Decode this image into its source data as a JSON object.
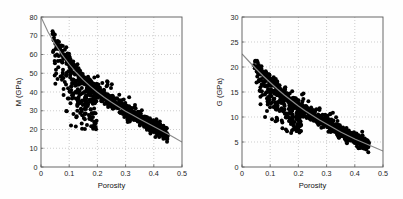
{
  "figure": {
    "name": "porosity-vs-elastic-moduli-scatter-figure",
    "background_color": "#fefefe",
    "panel_count": 2
  },
  "chart_data": [
    {
      "type": "scatter",
      "id": "left-panel",
      "title": "",
      "xlabel": "Porosity",
      "ylabel": "M (GPa)",
      "xlim": [
        0,
        0.5
      ],
      "ylim": [
        0,
        80
      ],
      "xticks": [
        0,
        0.1,
        0.2,
        0.3,
        0.4,
        0.5
      ],
      "xticklabels": [
        "0",
        "0.1",
        "0.2",
        "0.3",
        "0.4",
        "0.5"
      ],
      "yticks": [
        0,
        10,
        20,
        30,
        40,
        50,
        60,
        70,
        80
      ],
      "yticklabels": [
        "0",
        "10",
        "20",
        "30",
        "40",
        "50",
        "60",
        "70",
        "80"
      ],
      "grid": true,
      "legend": null,
      "marker_color": "#000000",
      "marker_size": 2.0,
      "trend_color": "#8a8a8a",
      "trend_label": "modified upper Hashin-Shtrikman / fit curve",
      "trend_points": [
        [
          0.0,
          80.0
        ],
        [
          0.025,
          72.0
        ],
        [
          0.05,
          65.5
        ],
        [
          0.075,
          59.8
        ],
        [
          0.1,
          54.8
        ],
        [
          0.125,
          50.4
        ],
        [
          0.15,
          46.5
        ],
        [
          0.175,
          43.0
        ],
        [
          0.2,
          39.9
        ],
        [
          0.225,
          37.1
        ],
        [
          0.25,
          34.5
        ],
        [
          0.275,
          32.1
        ],
        [
          0.3,
          29.8
        ],
        [
          0.325,
          27.7
        ],
        [
          0.35,
          25.6
        ],
        [
          0.375,
          23.6
        ],
        [
          0.4,
          21.6
        ],
        [
          0.425,
          19.6
        ],
        [
          0.45,
          17.6
        ],
        [
          0.475,
          15.5
        ],
        [
          0.5,
          13.3
        ]
      ],
      "main_trend_band": {
        "x_range": [
          0.04,
          0.45
        ],
        "half_width_y": 3.6,
        "description": "dense narrow cloud hugging the fit curve"
      },
      "scatter_subcloud": {
        "x_range": [
          0.04,
          0.2
        ],
        "y_range": [
          20,
          57
        ],
        "description": "diffuse low-modulus outlier population below main band"
      },
      "n_points": 900
    },
    {
      "type": "scatter",
      "id": "right-panel",
      "title": "",
      "xlabel": "Porosity",
      "ylabel": "G (GPa)",
      "xlim": [
        0,
        0.5
      ],
      "ylim": [
        0,
        30
      ],
      "xticks": [
        0,
        0.1,
        0.2,
        0.3,
        0.4,
        0.5
      ],
      "xticklabels": [
        "0",
        "0.1",
        "0.2",
        "0.3",
        "0.4",
        "0.5"
      ],
      "yticks": [
        0,
        5,
        10,
        15,
        20,
        25,
        30
      ],
      "yticklabels": [
        "0",
        "5",
        "10",
        "15",
        "20",
        "25",
        "30"
      ],
      "grid": true,
      "legend": null,
      "marker_color": "#000000",
      "marker_size": 2.0,
      "trend_color": "#8a8a8a",
      "trend_label": "modified upper Hashin-Shtrikman / fit curve",
      "trend_points": [
        [
          0.0,
          22.6
        ],
        [
          0.025,
          21.1
        ],
        [
          0.05,
          19.6
        ],
        [
          0.075,
          18.2
        ],
        [
          0.1,
          16.9
        ],
        [
          0.125,
          15.6
        ],
        [
          0.15,
          14.4
        ],
        [
          0.175,
          13.3
        ],
        [
          0.2,
          12.2
        ],
        [
          0.225,
          11.2
        ],
        [
          0.25,
          10.3
        ],
        [
          0.275,
          9.4
        ],
        [
          0.3,
          8.6
        ],
        [
          0.325,
          7.8
        ],
        [
          0.35,
          7.0
        ],
        [
          0.375,
          6.3
        ],
        [
          0.4,
          5.6
        ],
        [
          0.425,
          5.0
        ],
        [
          0.45,
          4.4
        ],
        [
          0.475,
          3.8
        ],
        [
          0.5,
          3.2
        ]
      ],
      "main_trend_band": {
        "x_range": [
          0.04,
          0.45
        ],
        "half_width_y": 1.15,
        "description": "dense narrow cloud hugging the fit curve"
      },
      "scatter_subcloud": {
        "x_range": [
          0.05,
          0.21
        ],
        "y_range": [
          6.5,
          16.5
        ],
        "description": "diffuse low-shear-modulus outlier population below main band"
      },
      "n_points": 900
    }
  ]
}
